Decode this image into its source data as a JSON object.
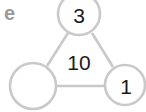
{
  "diagram": {
    "label": "e",
    "center_value": "10",
    "nodes": [
      {
        "id": "top",
        "value": "3"
      },
      {
        "id": "bottom-left",
        "value": ""
      },
      {
        "id": "bottom-right",
        "value": "1"
      }
    ],
    "colors": {
      "stroke": "#c9c9c9",
      "text": "#1a1a1a",
      "label": "#9a9a9a"
    }
  }
}
